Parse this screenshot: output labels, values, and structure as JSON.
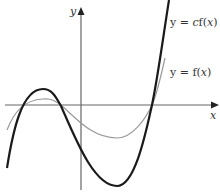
{
  "diagram": {
    "axes": {
      "x_label": "x",
      "y_label": "y",
      "axis_color": "#666666"
    },
    "curves": [
      {
        "name": "cf",
        "label": "y = cf(x)",
        "label_parts": [
          "y = ",
          "c",
          "f(",
          "x",
          ")"
        ],
        "stroke": "#1a1a1a",
        "width": 2.2
      },
      {
        "name": "f",
        "label": "y = f(x)",
        "label_parts": [
          "y = f(",
          "x",
          ")"
        ],
        "stroke": "#999999",
        "width": 1.2
      }
    ]
  }
}
